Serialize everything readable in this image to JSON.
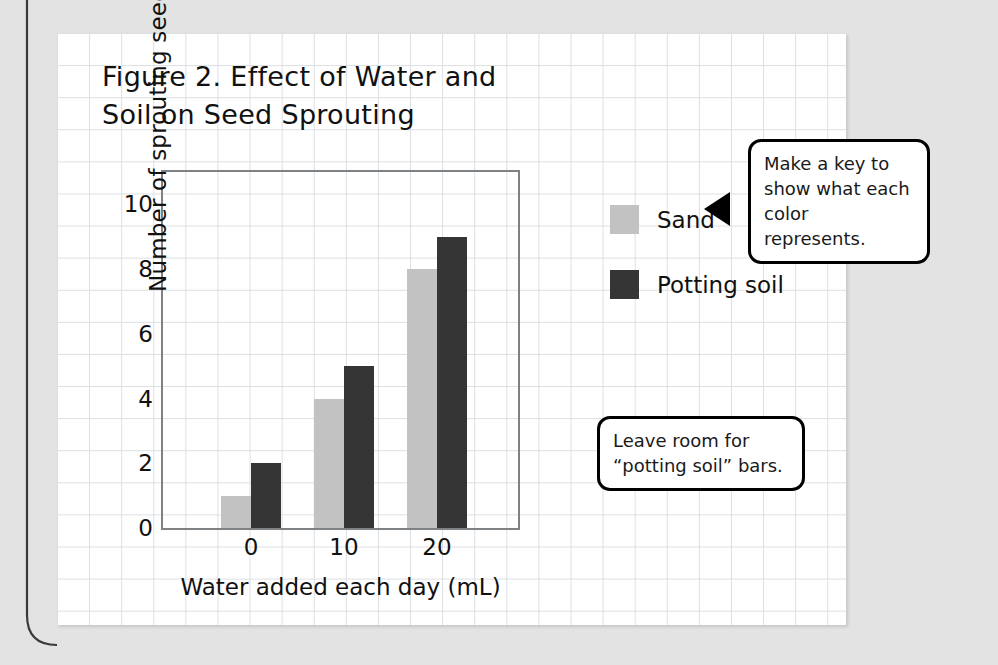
{
  "figure": {
    "title": "Figure 2. Effect of Water and\nSoil on Seed Sprouting"
  },
  "chart_data": {
    "type": "bar",
    "title": "Figure 2. Effect of Water and Soil on Seed Sprouting",
    "xlabel": "Water added each day (mL)",
    "ylabel": "Number of sprouting seeds",
    "categories": [
      "0",
      "10",
      "20"
    ],
    "series": [
      {
        "name": "Sand",
        "color": "#c2c2c2",
        "values": [
          1,
          4,
          8
        ]
      },
      {
        "name": "Potting soil",
        "color": "#353535",
        "values": [
          2,
          5,
          9
        ]
      }
    ],
    "ylim": [
      0,
      11
    ],
    "yticks": [
      0,
      2,
      4,
      6,
      8,
      10
    ],
    "ytick_labels": [
      "0",
      "2",
      "4",
      "6",
      "8",
      "10"
    ],
    "grid": true,
    "legend_position": "right"
  },
  "legend": {
    "items": [
      {
        "label": "Sand",
        "color": "#c2c2c2"
      },
      {
        "label": "Potting soil",
        "color": "#353535"
      }
    ]
  },
  "callouts": {
    "key": "Make a key to\nshow what each\ncolor represents.",
    "room": "Leave room for\n“potting soil” bars."
  },
  "colors": {
    "sand": "#c2c2c2",
    "potting_soil": "#353535",
    "page_background": "#e3e3e3",
    "grid_line": "#dcdfe2",
    "axis_line": "#7e8285"
  }
}
